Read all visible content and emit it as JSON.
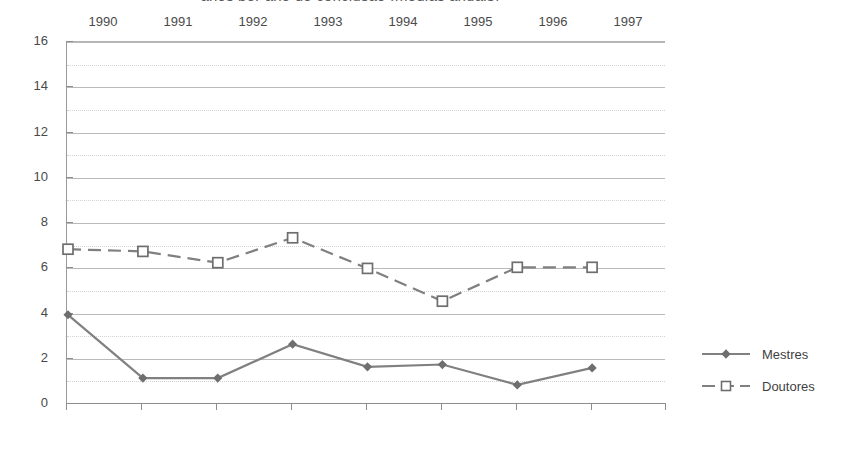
{
  "chart_data": {
    "type": "line",
    "title": "anos por ano de conclusão (médias anuais)",
    "xlabel": "",
    "ylabel": "",
    "categories": [
      "1990",
      "1991",
      "1992",
      "1993",
      "1994",
      "1995",
      "1996",
      "1997"
    ],
    "series": [
      {
        "name": "Mestres",
        "values": [
          3.9,
          1.1,
          1.1,
          2.6,
          1.6,
          1.7,
          0.8,
          1.55
        ],
        "line_style": "solid",
        "marker": "filled-diamond",
        "color": "#808080"
      },
      {
        "name": "Doutores",
        "values": [
          6.8,
          6.7,
          6.2,
          7.3,
          5.95,
          4.5,
          6.0,
          6.0
        ],
        "line_style": "dashed",
        "marker": "open-square",
        "color": "#808080"
      }
    ],
    "ylim": [
      0,
      16
    ],
    "ytick_step": 2,
    "yticks": [
      0,
      2,
      4,
      6,
      8,
      10,
      12,
      14,
      16
    ],
    "minor_yticks": [
      1,
      3,
      5,
      7,
      9,
      11,
      13,
      15
    ],
    "grid": "horizontal-major-solid-minor-dotted",
    "legend_position": "right"
  },
  "axes": {
    "y_labels": [
      "16",
      "14",
      "12",
      "10",
      "8",
      "6",
      "4",
      "2",
      "0"
    ],
    "x_labels": [
      "1990",
      "1991",
      "1992",
      "1993",
      "1994",
      "1995",
      "1996",
      "1997"
    ]
  },
  "legend": {
    "items": [
      {
        "label": "Mestres",
        "marker": "filled-diamond-icon",
        "style": "solid"
      },
      {
        "label": "Doutores",
        "marker": "open-square-icon",
        "style": "dashed"
      }
    ]
  },
  "colors": {
    "series_gray": "#808080",
    "grid_major": "#b9b9b9",
    "grid_minor": "#d2d2d2",
    "axis": "#8d8d8d",
    "text": "#4a4a4a",
    "background": "#ffffff"
  }
}
